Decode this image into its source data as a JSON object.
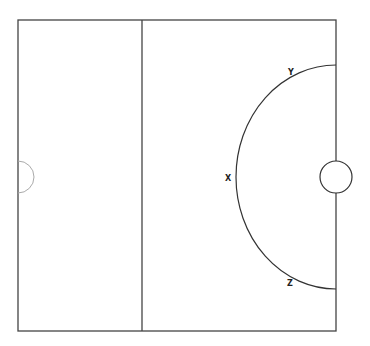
{
  "diagram": {
    "labels": {
      "y": "Y",
      "x": "X",
      "z": "Z"
    },
    "colors": {
      "line": "#333333",
      "light_line": "#aaaaaa",
      "background": "#ffffff"
    }
  }
}
